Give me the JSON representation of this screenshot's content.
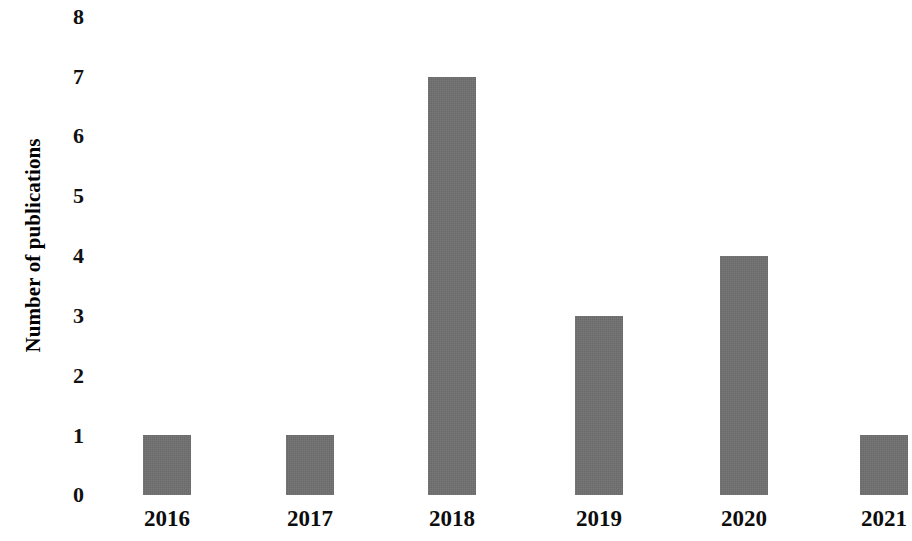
{
  "chart_data": {
    "type": "bar",
    "title": "",
    "subtitle": "",
    "xlabel": "",
    "ylabel": "Number of publications",
    "categories": [
      "2016",
      "2017",
      "2018",
      "2019",
      "2020",
      "2021"
    ],
    "values": [
      1,
      1,
      7,
      3,
      4,
      1
    ],
    "series": [
      {
        "name": "Number of publications",
        "values": [
          1,
          1,
          7,
          3,
          4,
          1
        ]
      }
    ],
    "ylim": [
      0,
      8
    ],
    "ytick_labels": [
      "8",
      "7",
      "6",
      "5",
      "4",
      "3",
      "2",
      "1",
      "0"
    ],
    "ytick_values": [
      8,
      7,
      6,
      5,
      4,
      3,
      2,
      1,
      0
    ],
    "grid": false,
    "legend": false,
    "legend_position": "none",
    "bar_color": "#6e6e6e",
    "background_color": "#ffffff",
    "text_color": "#000000",
    "annotations": []
  },
  "axes": {
    "y_title": "Number of publications"
  }
}
